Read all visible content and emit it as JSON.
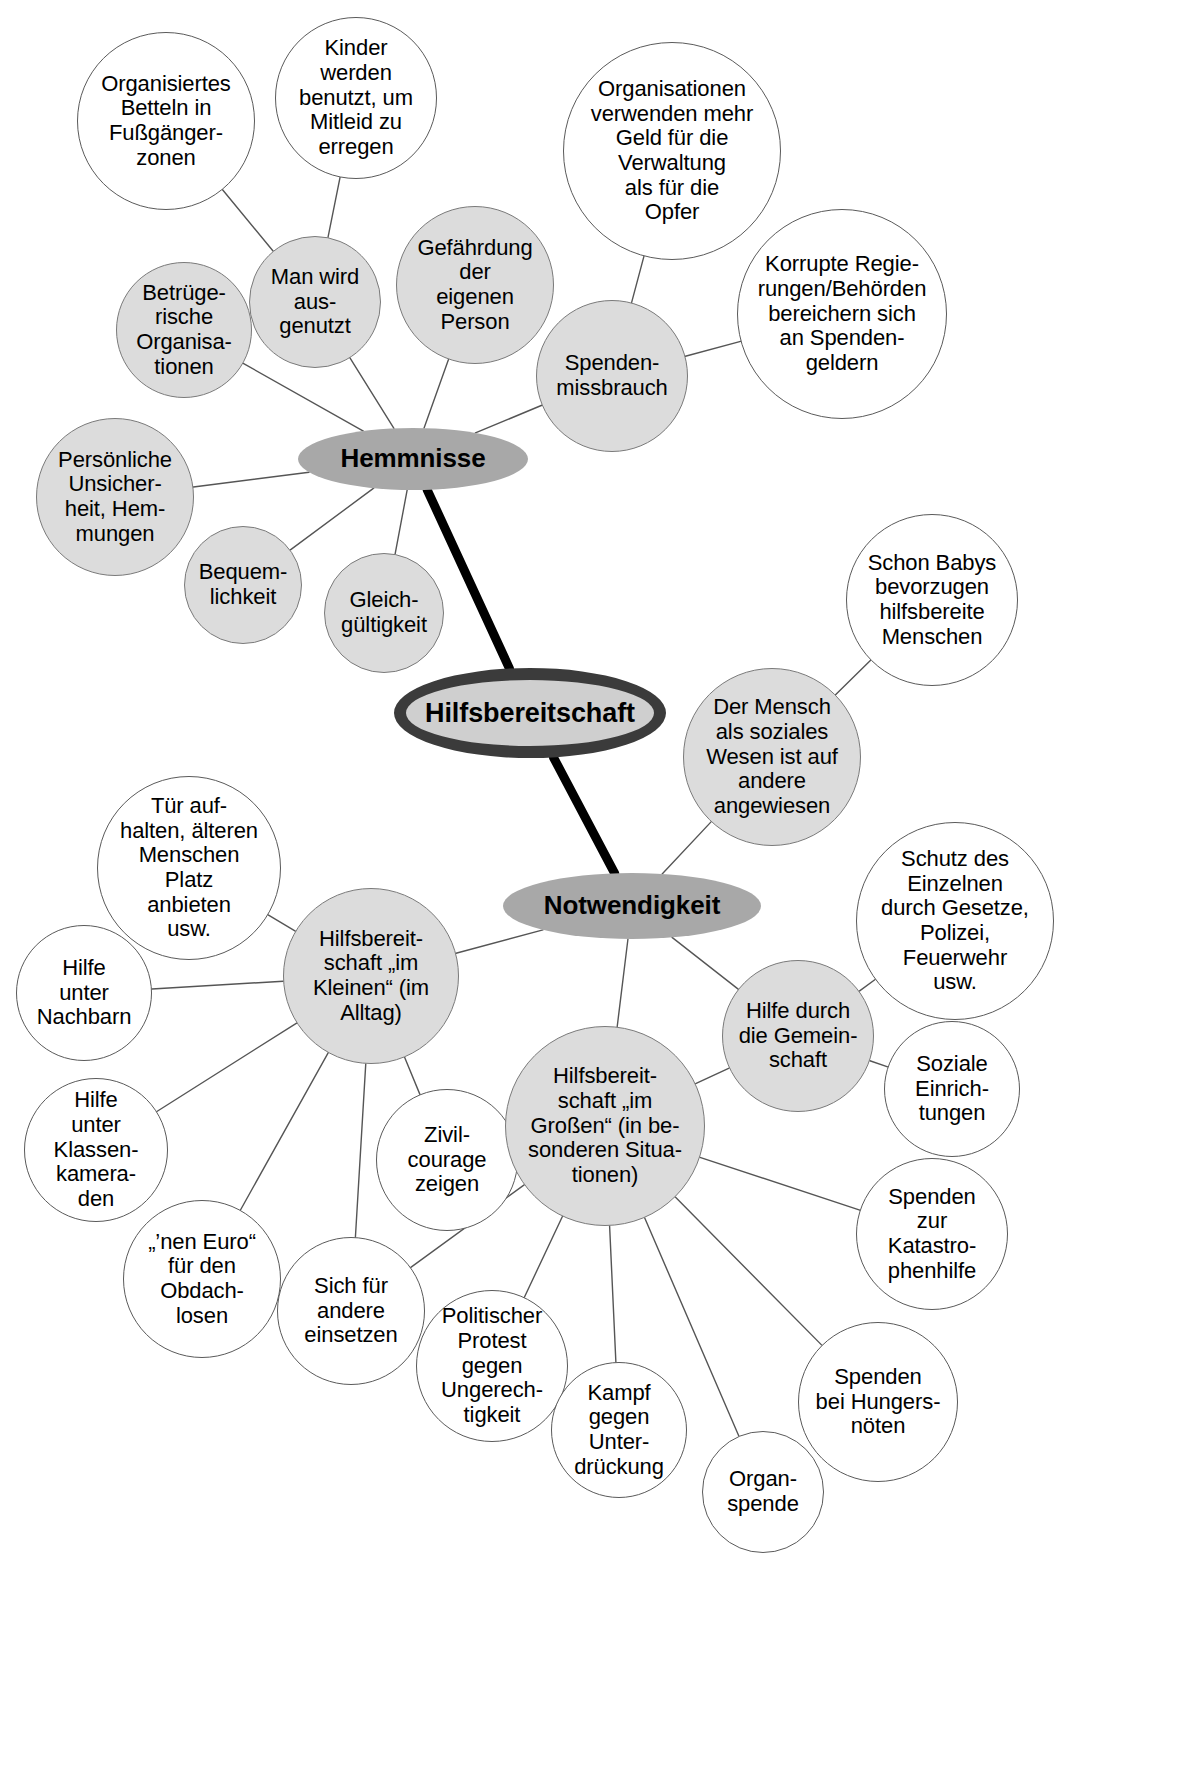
{
  "diagram": {
    "title": "Hilfsbereitschaft",
    "type": "mind-map",
    "language": "de",
    "colors": {
      "page_background": "#ffffff",
      "leaf_white_fill": "#ffffff",
      "leaf_gray_fill": "#dcdcdc",
      "hub_fill": "#a8a8a8",
      "center_fill": "#cfcfcf",
      "center_ring": "#3b3b3b",
      "edge_thin": "#555555",
      "edge_thick": "#000000",
      "text": "#000000"
    },
    "centers": [
      {
        "id": "hemmnisse",
        "label": "Hemmnisse",
        "shape": "ellipse",
        "style": "hub",
        "x": 298,
        "y": 428,
        "w": 230,
        "h": 62,
        "font": 26
      },
      {
        "id": "hilfsbereitschaft",
        "label": "Hilfsbereitschaft",
        "shape": "ellipse",
        "style": "center",
        "x": 394,
        "y": 668,
        "w": 272,
        "h": 90,
        "font": 27
      },
      {
        "id": "notwendigkeit",
        "label": "Notwendigkeit",
        "shape": "ellipse",
        "style": "hub",
        "x": 503,
        "y": 873,
        "w": 258,
        "h": 66,
        "font": 26
      }
    ],
    "nodes": [
      {
        "id": "betteln",
        "label": "Organisiertes\nBetteln in\nFußgänger-\nzonen",
        "fill": "white",
        "x": 77,
        "y": 32,
        "d": 178,
        "font": 22
      },
      {
        "id": "kinder",
        "label": "Kinder\nwerden\nbenutzt, um\nMitleid zu\nerregen",
        "fill": "white",
        "x": 275,
        "y": 17,
        "d": 162,
        "font": 22
      },
      {
        "id": "organisationen",
        "label": "Organisationen\nverwenden mehr\nGeld für die\nVerwaltung\nals für die\nOpfer",
        "fill": "white",
        "x": 563,
        "y": 42,
        "d": 218,
        "font": 22
      },
      {
        "id": "korrupt",
        "label": "Korrupte Regie-\nrungen/Behörden\nbereichern sich\nan Spenden-\ngeldern",
        "fill": "white",
        "x": 737,
        "y": 209,
        "d": 210,
        "font": 22
      },
      {
        "id": "gefaehrdung",
        "label": "Gefährdung\nder\neigenen\nPerson",
        "fill": "gray",
        "x": 396,
        "y": 206,
        "d": 158,
        "font": 22
      },
      {
        "id": "ausgenutzt",
        "label": "Man wird\naus-\ngenutzt",
        "fill": "gray",
        "x": 249,
        "y": 236,
        "d": 132,
        "font": 22
      },
      {
        "id": "betruegerisch",
        "label": "Betrüge-\nrische\nOrganisa-\ntionen",
        "fill": "gray",
        "x": 116,
        "y": 262,
        "d": 136,
        "font": 22
      },
      {
        "id": "spendenmiss",
        "label": "Spenden-\nmissbrauch",
        "fill": "gray",
        "x": 536,
        "y": 300,
        "d": 152,
        "font": 22
      },
      {
        "id": "unsicherheit",
        "label": "Persönliche\nUnsicher-\nheit, Hem-\nmungen",
        "fill": "gray",
        "x": 36,
        "y": 418,
        "d": 158,
        "font": 22
      },
      {
        "id": "bequemlich",
        "label": "Bequem-\nlichkeit",
        "fill": "gray",
        "x": 184,
        "y": 526,
        "d": 118,
        "font": 22
      },
      {
        "id": "gleichgueltig",
        "label": "Gleich-\ngültigkeit",
        "fill": "gray",
        "x": 324,
        "y": 553,
        "d": 120,
        "font": 22
      },
      {
        "id": "babys",
        "label": "Schon Babys\nbevorzugen\nhilfsbereite\nMenschen",
        "fill": "white",
        "x": 846,
        "y": 514,
        "d": 172,
        "font": 22
      },
      {
        "id": "sozialeswesen",
        "label": "Der Mensch\nals soziales\nWesen ist auf\nandere\nangewiesen",
        "fill": "gray",
        "x": 683,
        "y": 668,
        "d": 178,
        "font": 22
      },
      {
        "id": "schutz",
        "label": "Schutz des\nEinzelnen\ndurch Gesetze,\nPolizei,\nFeuerwehr\nusw.",
        "fill": "white",
        "x": 856,
        "y": 822,
        "d": 198,
        "font": 22
      },
      {
        "id": "gemeinschaft",
        "label": "Hilfe durch\ndie Gemein-\nschaft",
        "fill": "gray",
        "x": 722,
        "y": 960,
        "d": 152,
        "font": 22
      },
      {
        "id": "sozeinricht",
        "label": "Soziale\nEinrich-\ntungen",
        "fill": "white",
        "x": 884,
        "y": 1021,
        "d": 136,
        "font": 22
      },
      {
        "id": "tuer",
        "label": "Tür auf-\nhalten, älteren\nMenschen\nPlatz\nanbieten\nusw.",
        "fill": "white",
        "x": 97,
        "y": 776,
        "d": 184,
        "font": 22
      },
      {
        "id": "kleinen",
        "label": "Hilfsbereit-\nschaft „im\nKleinen“ (im\nAlltag)",
        "fill": "gray",
        "x": 283,
        "y": 888,
        "d": 176,
        "font": 22
      },
      {
        "id": "nachbarn",
        "label": "Hilfe\nunter\nNachbarn",
        "fill": "white",
        "x": 16,
        "y": 925,
        "d": 136,
        "font": 22
      },
      {
        "id": "klassenkam",
        "label": "Hilfe\nunter\nKlassen-\nkamera-\nden",
        "fill": "white",
        "x": 24,
        "y": 1078,
        "d": 144,
        "font": 22
      },
      {
        "id": "euro",
        "label": "„’nen Euro“\nfür den\nObdach-\nlosen",
        "fill": "white",
        "x": 123,
        "y": 1200,
        "d": 158,
        "font": 22
      },
      {
        "id": "sicheinsetzen",
        "label": "Sich für\nandere\neinsetzen",
        "fill": "white",
        "x": 277,
        "y": 1237,
        "d": 148,
        "font": 22
      },
      {
        "id": "zivilcourage",
        "label": "Zivil-\ncourage\nzeigen",
        "fill": "white",
        "x": 376,
        "y": 1089,
        "d": 142,
        "font": 22
      },
      {
        "id": "grossen",
        "label": "Hilfsbereit-\nschaft „im\nGroßen“ (in be-\nsonderen Situa-\ntionen)",
        "fill": "gray",
        "x": 505,
        "y": 1026,
        "d": 200,
        "font": 22
      },
      {
        "id": "protest",
        "label": "Politischer\nProtest\ngegen\nUngerech-\ntigkeit",
        "fill": "white",
        "x": 416,
        "y": 1290,
        "d": 152,
        "font": 22
      },
      {
        "id": "kampf",
        "label": "Kampf\ngegen\nUnter-\ndrückung",
        "fill": "white",
        "x": 551,
        "y": 1362,
        "d": 136,
        "font": 22
      },
      {
        "id": "organspende",
        "label": "Organ-\nspende",
        "fill": "white",
        "x": 702,
        "y": 1431,
        "d": 122,
        "font": 22
      },
      {
        "id": "hungersnot",
        "label": "Spenden\nbei Hungers-\nnöten",
        "fill": "white",
        "x": 798,
        "y": 1322,
        "d": 160,
        "font": 22
      },
      {
        "id": "katastrophe",
        "label": "Spenden\nzur\nKatastro-\nphenhilfe",
        "fill": "white",
        "x": 856,
        "y": 1158,
        "d": 152,
        "font": 22
      }
    ],
    "edges": [
      {
        "from": "betteln",
        "to": "ausgenutzt",
        "weight": "thin"
      },
      {
        "from": "kinder",
        "to": "ausgenutzt",
        "weight": "thin"
      },
      {
        "from": "ausgenutzt",
        "to": "hemmnisse",
        "weight": "thin"
      },
      {
        "from": "betruegerisch",
        "to": "hemmnisse",
        "weight": "thin"
      },
      {
        "from": "gefaehrdung",
        "to": "hemmnisse",
        "weight": "thin"
      },
      {
        "from": "organisationen",
        "to": "spendenmiss",
        "weight": "thin"
      },
      {
        "from": "korrupt",
        "to": "spendenmiss",
        "weight": "thin"
      },
      {
        "from": "spendenmiss",
        "to": "hemmnisse",
        "weight": "thin"
      },
      {
        "from": "unsicherheit",
        "to": "hemmnisse",
        "weight": "thin"
      },
      {
        "from": "bequemlich",
        "to": "hemmnisse",
        "weight": "thin"
      },
      {
        "from": "gleichgueltig",
        "to": "hemmnisse",
        "weight": "thin"
      },
      {
        "from": "hemmnisse",
        "to": "hilfsbereitschaft",
        "weight": "thick"
      },
      {
        "from": "hilfsbereitschaft",
        "to": "notwendigkeit",
        "weight": "thick"
      },
      {
        "from": "babys",
        "to": "sozialeswesen",
        "weight": "thin"
      },
      {
        "from": "sozialeswesen",
        "to": "notwendigkeit",
        "weight": "thin"
      },
      {
        "from": "schutz",
        "to": "gemeinschaft",
        "weight": "thin"
      },
      {
        "from": "sozeinricht",
        "to": "gemeinschaft",
        "weight": "thin"
      },
      {
        "from": "gemeinschaft",
        "to": "notwendigkeit",
        "weight": "thin"
      },
      {
        "from": "kleinen",
        "to": "notwendigkeit",
        "weight": "thin"
      },
      {
        "from": "grossen",
        "to": "notwendigkeit",
        "weight": "thin"
      },
      {
        "from": "tuer",
        "to": "kleinen",
        "weight": "thin"
      },
      {
        "from": "nachbarn",
        "to": "kleinen",
        "weight": "thin"
      },
      {
        "from": "klassenkam",
        "to": "kleinen",
        "weight": "thin"
      },
      {
        "from": "euro",
        "to": "kleinen",
        "weight": "thin"
      },
      {
        "from": "sicheinsetzen",
        "to": "kleinen",
        "weight": "thin"
      },
      {
        "from": "zivilcourage",
        "to": "kleinen",
        "weight": "thin"
      },
      {
        "from": "zivilcourage",
        "to": "grossen",
        "weight": "thin"
      },
      {
        "from": "sicheinsetzen",
        "to": "grossen",
        "weight": "thin"
      },
      {
        "from": "protest",
        "to": "grossen",
        "weight": "thin"
      },
      {
        "from": "kampf",
        "to": "grossen",
        "weight": "thin"
      },
      {
        "from": "organspende",
        "to": "grossen",
        "weight": "thin"
      },
      {
        "from": "hungersnot",
        "to": "grossen",
        "weight": "thin"
      },
      {
        "from": "katastrophe",
        "to": "grossen",
        "weight": "thin"
      },
      {
        "from": "gemeinschaft",
        "to": "grossen",
        "weight": "thin"
      }
    ]
  }
}
